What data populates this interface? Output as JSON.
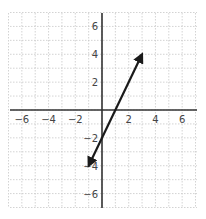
{
  "chart_data": {
    "type": "line",
    "title": "",
    "xlabel": "",
    "ylabel": "",
    "xlim": [
      -7,
      7
    ],
    "ylim": [
      -7,
      7
    ],
    "grid": true,
    "x_ticks": [
      -6,
      -4,
      -2,
      2,
      4,
      6
    ],
    "y_ticks": [
      6,
      4,
      2,
      -2,
      -4,
      -6
    ],
    "x_tick_labels": [
      "−6",
      "−4",
      "−2",
      "2",
      "4",
      "6"
    ],
    "y_tick_labels": [
      "6",
      "4",
      "2",
      "−2",
      "−4",
      "−6"
    ],
    "series": [
      {
        "name": "y = 2x − 2",
        "x": [
          -1,
          3
        ],
        "y": [
          -4,
          4
        ],
        "arrows": "both",
        "color": "#1a1a1a"
      }
    ]
  },
  "colors": {
    "grid": "#c8c8c8",
    "axis": "#333333",
    "line": "#1a1a1a"
  }
}
